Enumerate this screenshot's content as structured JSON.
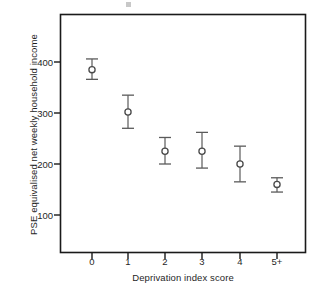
{
  "chart_data": {
    "type": "scatter",
    "title": "",
    "xlabel": "Deprivation index score",
    "ylabel": "PSE equivalised net weekly household income",
    "categories": [
      "0",
      "1",
      "2",
      "3",
      "4",
      "5+"
    ],
    "values": [
      385,
      302,
      225,
      225,
      200,
      160
    ],
    "error_low": [
      366,
      270,
      200,
      192,
      165,
      145
    ],
    "error_high": [
      406,
      335,
      252,
      262,
      235,
      173
    ],
    "yticks": [
      100,
      200,
      300,
      400
    ],
    "ytick_labels": [
      "100",
      "200",
      "300",
      "400"
    ],
    "ylim": [
      75,
      455
    ],
    "xlim": [
      -0.62,
      5.62
    ],
    "grid": false,
    "legend": null,
    "marker": "open-circle",
    "series": [
      {
        "name": "PSE equivalised net weekly household income",
        "points": [
          {
            "x": "0",
            "y": 385,
            "low": 366,
            "high": 406
          },
          {
            "x": "1",
            "y": 302,
            "low": 270,
            "high": 335
          },
          {
            "x": "2",
            "y": 225,
            "low": 200,
            "high": 252
          },
          {
            "x": "3",
            "y": 225,
            "low": 192,
            "high": 262
          },
          {
            "x": "4",
            "y": 200,
            "low": 165,
            "high": 235
          },
          {
            "x": "5+",
            "y": 160,
            "low": 145,
            "high": 173
          }
        ]
      }
    ],
    "colors": {
      "axis": "#1a1a1a",
      "marker": "#4a4a4a",
      "errorbar": "#5a5a5a",
      "background": "#ffffff"
    }
  }
}
